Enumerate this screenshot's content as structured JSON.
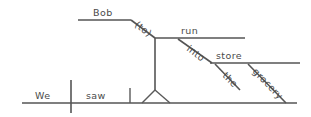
{
  "diagram": {
    "type": "reed-kellogg-sentence-diagram",
    "sentence": "We saw Bob run into the grocery store.",
    "baseline": {
      "subject": "We",
      "verb": "saw",
      "object_complement": "Bob"
    },
    "words": {
      "we": "We",
      "saw": "saw",
      "bob": "Bob",
      "to": "(to)",
      "run": "run",
      "into": "into",
      "store": "store",
      "the": "the",
      "grocery": "grocery"
    },
    "colors": {
      "line": "#555555",
      "text": "#4a4a4a",
      "background": "#ffffff"
    }
  }
}
